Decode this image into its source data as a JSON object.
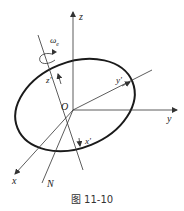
{
  "figure": {
    "caption": "图 11-10",
    "labels": {
      "z": "z",
      "y": "y",
      "x": "x",
      "origin": "O",
      "N": "N",
      "z_prime": "z'",
      "y_prime": "y'",
      "x_prime": "x'",
      "omega": "ω",
      "omega_sub": "e"
    },
    "colors": {
      "line": "#333333",
      "ellipse": "#1a1a1a"
    }
  }
}
